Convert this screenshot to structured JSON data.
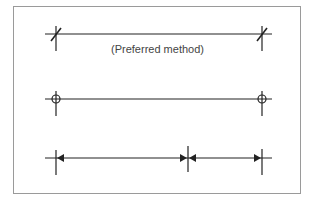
{
  "figure": {
    "caption": "(Preferred method)",
    "rows": [
      {
        "name": "slash-terminator",
        "description": "Dimension line with oblique slash terminators (preferred)"
      },
      {
        "name": "dot-circle-terminator",
        "description": "Dimension line with open circle terminators"
      },
      {
        "name": "arrow-terminator",
        "description": "Chained dimension lines with filled arrowhead terminators"
      }
    ],
    "colors": {
      "line": "#222222",
      "frame": "#9a9a9a",
      "text": "#444444"
    }
  }
}
